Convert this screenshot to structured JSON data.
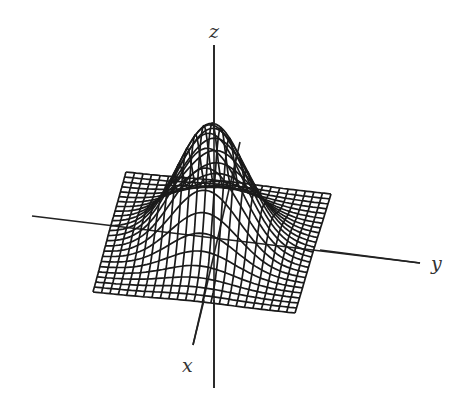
{
  "figure": {
    "title": "",
    "colors": {
      "background": "#ffffff",
      "wire": "#1a1a1a",
      "axis": "#222222",
      "label": "#333333"
    }
  },
  "axes": {
    "z": {
      "label": "z",
      "from": [
        214,
        388
      ],
      "to": [
        214,
        45
      ],
      "label_pos": [
        209,
        22
      ]
    },
    "y": {
      "label": "y",
      "from": [
        32,
        216
      ],
      "to": [
        420,
        263
      ],
      "label_pos": [
        431,
        254
      ]
    },
    "x": {
      "label": "x",
      "from": [
        240,
        142
      ],
      "to": [
        193,
        345
      ],
      "label_pos": [
        182,
        356
      ]
    }
  },
  "surface": {
    "function": "gaussian",
    "grid_n": 24,
    "domain": [
      -2,
      2
    ],
    "corners": {
      "back_left": [
        126,
        172
      ],
      "back_right": [
        331,
        194
      ],
      "front_right": [
        295,
        313
      ],
      "front_left": [
        93,
        292
      ]
    },
    "peak_height_px": 118
  }
}
